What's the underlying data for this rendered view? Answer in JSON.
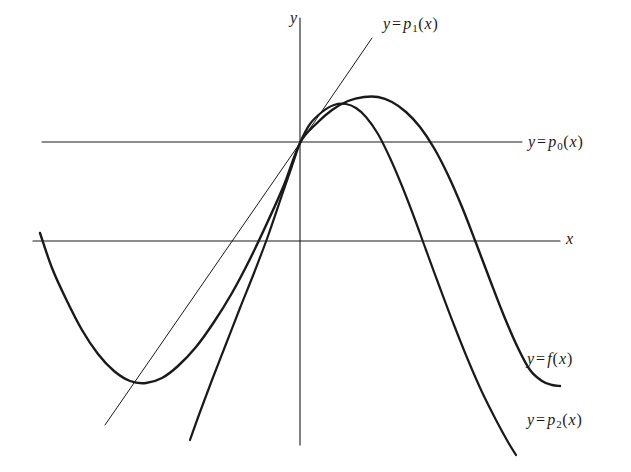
{
  "figure": {
    "kind": "mathematical-graph",
    "background_color": "#ffffff",
    "ink_color": "#1a1a1a",
    "width": 631,
    "height": 472
  },
  "axes": {
    "x_axis_label": "x",
    "y_axis_label": "y",
    "origin": {
      "x": 300,
      "y": 143
    },
    "x_axis_line": {
      "x1": 33,
      "y1": 241,
      "x2": 560,
      "y2": 241
    },
    "y_axis_line": {
      "x1": 300,
      "y1": 18,
      "x2": 300,
      "y2": 445
    }
  },
  "labels": {
    "p1": {
      "prefix": "y",
      "eq": "=",
      "name": "p",
      "sub": "1",
      "open": "(",
      "arg": "x",
      "close": ")",
      "full": "y = p1(x)"
    },
    "p0": {
      "prefix": "y",
      "eq": "=",
      "name": "p",
      "sub": "0",
      "open": "(",
      "arg": "x",
      "close": ")",
      "full": "y = p0(x)"
    },
    "f": {
      "prefix": "y",
      "eq": "=",
      "name": "f",
      "sub": "",
      "open": "(",
      "arg": "x",
      "close": ")",
      "full": "y = f(x)"
    },
    "p2": {
      "prefix": "y",
      "eq": "=",
      "name": "p",
      "sub": "2",
      "open": "(",
      "arg": "x",
      "close": ")",
      "full": "y = p2(x)"
    }
  },
  "chart_data": {
    "type": "line",
    "title": "",
    "xlabel": "x",
    "ylabel": "y",
    "grid": false,
    "legend": "inline-end-labels",
    "origin_px": {
      "x": 300,
      "y": 143
    },
    "series": [
      {
        "name": "y = f(x)",
        "role": "function",
        "stroke_width": 2.4,
        "path_points_px": [
          [
            40,
            233
          ],
          [
            52,
            268
          ],
          [
            66,
            299
          ],
          [
            82,
            330
          ],
          [
            98,
            354
          ],
          [
            114,
            371
          ],
          [
            130,
            381
          ],
          [
            146,
            383
          ],
          [
            162,
            378
          ],
          [
            178,
            366
          ],
          [
            196,
            347
          ],
          [
            214,
            322
          ],
          [
            232,
            293
          ],
          [
            250,
            259
          ],
          [
            268,
            221
          ],
          [
            284,
            185
          ],
          [
            300,
            143
          ],
          [
            316,
            124
          ],
          [
            332,
            110
          ],
          [
            348,
            101
          ],
          [
            364,
            97
          ],
          [
            378,
            97
          ],
          [
            392,
            102
          ],
          [
            406,
            112
          ],
          [
            420,
            127
          ],
          [
            434,
            148
          ],
          [
            448,
            175
          ],
          [
            462,
            207
          ],
          [
            476,
            243
          ],
          [
            490,
            280
          ],
          [
            504,
            316
          ],
          [
            518,
            348
          ],
          [
            530,
            370
          ],
          [
            542,
            381
          ],
          [
            552,
            385
          ],
          [
            560,
            386
          ]
        ]
      },
      {
        "name": "y = p2(x)",
        "role": "quadratic-approximation",
        "stroke_width": 2.2,
        "path_points_px": [
          [
            190,
            440
          ],
          [
            200,
            412
          ],
          [
            212,
            380
          ],
          [
            226,
            344
          ],
          [
            240,
            308
          ],
          [
            254,
            273
          ],
          [
            268,
            236
          ],
          [
            282,
            195
          ],
          [
            292,
            166
          ],
          [
            300,
            143
          ],
          [
            310,
            124
          ],
          [
            322,
            112
          ],
          [
            334,
            105
          ],
          [
            346,
            104
          ],
          [
            356,
            108
          ],
          [
            366,
            117
          ],
          [
            378,
            134
          ],
          [
            390,
            158
          ],
          [
            402,
            186
          ],
          [
            414,
            217
          ],
          [
            426,
            250
          ],
          [
            440,
            288
          ],
          [
            454,
            325
          ],
          [
            468,
            360
          ],
          [
            482,
            392
          ],
          [
            496,
            420
          ],
          [
            508,
            442
          ],
          [
            516,
            455
          ]
        ]
      },
      {
        "name": "y = p1(x)",
        "role": "linear-approximation-tangent",
        "stroke_width": 1.0,
        "path_points_px": [
          [
            372,
            38
          ],
          [
            300,
            143
          ],
          [
            105,
            425
          ]
        ]
      },
      {
        "name": "y = p0(x)",
        "role": "constant-approximation",
        "stroke_width": 1.0,
        "path_points_px": [
          [
            42,
            142
          ],
          [
            522,
            142
          ]
        ]
      }
    ],
    "annotations": [
      {
        "text": "y = p1(x)",
        "x": 385,
        "y": 22
      },
      {
        "text": "y = p0(x)",
        "x": 528,
        "y": 133
      },
      {
        "text": "x",
        "x": 568,
        "y": 232
      },
      {
        "text": "y",
        "x": 292,
        "y": 18
      },
      {
        "text": "y = f(x)",
        "x": 527,
        "y": 350
      },
      {
        "text": "y = p2(x)",
        "x": 527,
        "y": 410
      }
    ]
  }
}
